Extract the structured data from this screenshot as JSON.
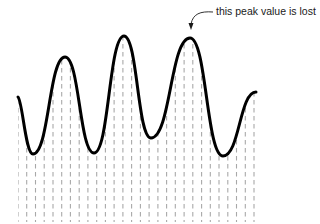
{
  "diagram": {
    "annotation": {
      "text": "this peak value is lost",
      "arrow_target": "third peak"
    },
    "colors": {
      "waveform": "#000000",
      "sample_lines": "#a8a8a8",
      "text": "#1a1a1a",
      "background": "#ffffff"
    },
    "waveform_points": [
      [
        18,
        97
      ],
      [
        33,
        154
      ],
      [
        65,
        57
      ],
      [
        94,
        153
      ],
      [
        124,
        36
      ],
      [
        151,
        138
      ],
      [
        190,
        38
      ],
      [
        223,
        156
      ],
      [
        256,
        92
      ]
    ],
    "sample_lines": {
      "count": 28,
      "x_start": 18,
      "x_end": 254,
      "bottom_y": 222
    }
  }
}
